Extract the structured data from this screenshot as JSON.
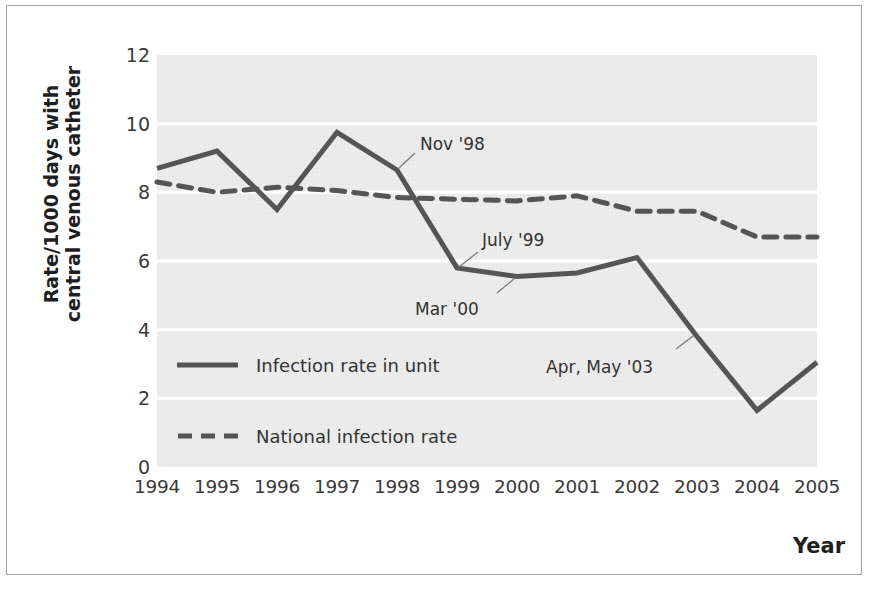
{
  "chart_data": {
    "type": "line",
    "title": "",
    "xlabel": "Year",
    "ylabel": "Rate/1000 days with central venous catheter",
    "ylabel_lines": [
      "Rate/1000 days with",
      "central venous catheter"
    ],
    "x": [
      1994,
      1995,
      1996,
      1997,
      1998,
      1999,
      2000,
      2001,
      2002,
      2003,
      2004,
      2005
    ],
    "categories": [
      "1994",
      "1995",
      "1996",
      "1997",
      "1998",
      "1999",
      "2000",
      "2001",
      "2002",
      "2003",
      "2004",
      "2005"
    ],
    "yticks": [
      "0",
      "2",
      "4",
      "6",
      "8",
      "10",
      "12"
    ],
    "ylim": [
      0,
      12
    ],
    "grid": "horizontal white gridlines on grey background",
    "series": [
      {
        "name": "Infection rate in unit",
        "style": "solid",
        "color": "#555555",
        "values": [
          8.7,
          9.2,
          7.5,
          9.75,
          8.65,
          5.8,
          5.55,
          5.65,
          6.1,
          3.8,
          1.65,
          3.05
        ]
      },
      {
        "name": "National infection rate",
        "style": "dashed",
        "color": "#555555",
        "values": [
          8.3,
          8.0,
          8.15,
          8.05,
          7.85,
          7.8,
          7.75,
          7.9,
          7.45,
          7.45,
          6.7,
          6.7
        ]
      }
    ],
    "annotations": [
      {
        "label": "Nov '98",
        "x": 1998.0,
        "y": 8.65
      },
      {
        "label": "July '99",
        "x": 1999.0,
        "y": 5.8
      },
      {
        "label": "Mar '00",
        "x": 2000.0,
        "y": 5.55
      },
      {
        "label": "Apr, May '03",
        "x": 2002.95,
        "y": 3.85
      }
    ],
    "legend": {
      "position": "inside lower-left",
      "entries": [
        {
          "label": "Infection rate in unit",
          "style": "solid"
        },
        {
          "label": "National infection rate",
          "style": "dashed"
        }
      ]
    }
  },
  "colors": {
    "plot_background": "#ebebeb",
    "gridline": "#ffffff",
    "line": "#555555",
    "frame": "#a8a8a8"
  }
}
